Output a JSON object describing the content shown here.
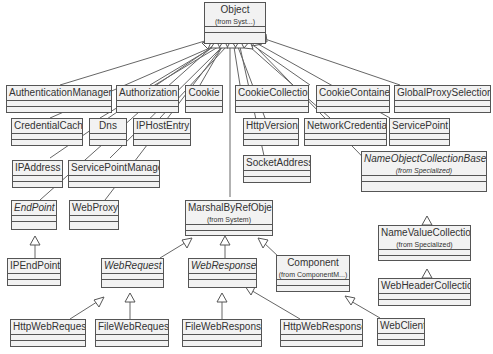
{
  "diagram": {
    "type": "UML class diagram",
    "root": {
      "name": "Object",
      "from": "(from Syst...)"
    },
    "classes": [
      {
        "id": "object",
        "name": "Object",
        "from": "(from Syst...)",
        "abstract": false
      },
      {
        "id": "authmgr",
        "name": "AuthenticationManager",
        "abstract": false
      },
      {
        "id": "authorization",
        "name": "Authorization",
        "abstract": false
      },
      {
        "id": "cookie",
        "name": "Cookie",
        "abstract": false
      },
      {
        "id": "cookiecoll",
        "name": "CookieCollection",
        "abstract": false
      },
      {
        "id": "cookiecont",
        "name": "CookieContainer",
        "abstract": false
      },
      {
        "id": "globalproxy",
        "name": "GlobalProxySelection",
        "abstract": false
      },
      {
        "id": "credcache",
        "name": "CredentialCache",
        "abstract": false
      },
      {
        "id": "dns",
        "name": "Dns",
        "abstract": false
      },
      {
        "id": "iphostentry",
        "name": "IPHostEntry",
        "abstract": false
      },
      {
        "id": "httpversion",
        "name": "HttpVersion",
        "abstract": false
      },
      {
        "id": "netcred",
        "name": "NetworkCredential",
        "abstract": false
      },
      {
        "id": "servicepoint",
        "name": "ServicePoint",
        "abstract": false
      },
      {
        "id": "ipaddress",
        "name": "IPAddress",
        "abstract": false
      },
      {
        "id": "spm",
        "name": "ServicePointManager",
        "abstract": false
      },
      {
        "id": "socketaddr",
        "name": "SocketAddress",
        "abstract": false
      },
      {
        "id": "nocb",
        "name": "NameObjectCollectionBase",
        "from": "(from Specialized)",
        "abstract": true
      },
      {
        "id": "endpoint",
        "name": "EndPoint",
        "abstract": true
      },
      {
        "id": "webproxy",
        "name": "WebProxy",
        "abstract": false
      },
      {
        "id": "mbro",
        "name": "MarshalByRefObject",
        "from": "(from System)",
        "abstract": false
      },
      {
        "id": "nvc",
        "name": "NameValueCollection",
        "from": "(from Specialized)",
        "abstract": false
      },
      {
        "id": "ipendpoint",
        "name": "IPEndPoint",
        "abstract": false
      },
      {
        "id": "webrequest",
        "name": "WebRequest",
        "abstract": true
      },
      {
        "id": "webresponse",
        "name": "WebResponse",
        "abstract": true
      },
      {
        "id": "component",
        "name": "Component",
        "from": "(from ComponentM...)",
        "abstract": false
      },
      {
        "id": "whc",
        "name": "WebHeaderCollection",
        "abstract": false
      },
      {
        "id": "httpwebrequest",
        "name": "HttpWebRequest",
        "abstract": false
      },
      {
        "id": "filewebrequest",
        "name": "FileWebRequest",
        "abstract": false
      },
      {
        "id": "filewebresponse",
        "name": "FileWebResponse",
        "abstract": false
      },
      {
        "id": "httpwebresponse",
        "name": "HttpWebResponse",
        "abstract": false
      },
      {
        "id": "webclient",
        "name": "WebClient",
        "abstract": false
      }
    ],
    "generalizations": [
      [
        "authmgr",
        "object"
      ],
      [
        "authorization",
        "object"
      ],
      [
        "cookie",
        "object"
      ],
      [
        "cookiecoll",
        "object"
      ],
      [
        "cookiecont",
        "object"
      ],
      [
        "globalproxy",
        "object"
      ],
      [
        "credcache",
        "object"
      ],
      [
        "dns",
        "object"
      ],
      [
        "iphostentry",
        "object"
      ],
      [
        "httpversion",
        "object"
      ],
      [
        "netcred",
        "object"
      ],
      [
        "servicepoint",
        "object"
      ],
      [
        "ipaddress",
        "object"
      ],
      [
        "spm",
        "object"
      ],
      [
        "socketaddr",
        "object"
      ],
      [
        "nocb",
        "object"
      ],
      [
        "endpoint",
        "object"
      ],
      [
        "webproxy",
        "object"
      ],
      [
        "mbro",
        "object"
      ],
      [
        "nvc",
        "nocb"
      ],
      [
        "whc",
        "nvc"
      ],
      [
        "ipendpoint",
        "endpoint"
      ],
      [
        "webrequest",
        "mbro"
      ],
      [
        "webresponse",
        "mbro"
      ],
      [
        "component",
        "mbro"
      ],
      [
        "httpwebrequest",
        "webrequest"
      ],
      [
        "filewebrequest",
        "webrequest"
      ],
      [
        "filewebresponse",
        "webresponse"
      ],
      [
        "httpwebresponse",
        "webresponse"
      ],
      [
        "webclient",
        "component"
      ]
    ]
  },
  "colors": {
    "box_fill": "#f2f2f2",
    "border": "#555555",
    "line": "#555555",
    "text": "#333333",
    "background": "#ffffff"
  }
}
